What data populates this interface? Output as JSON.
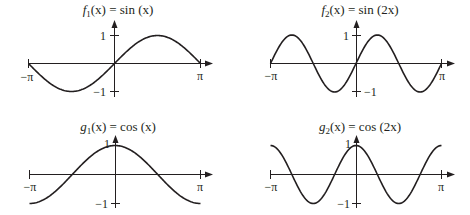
{
  "chart_data": [
    {
      "type": "line",
      "title": "f1(x) = sin (x)",
      "title_parts": {
        "fn": "f",
        "sub": "1",
        "rest": "(x) = sin (x)"
      },
      "x_ticks": [
        "−π",
        "π"
      ],
      "y_ticks": [
        "1",
        "−1"
      ],
      "xlim": [
        -3.14159,
        3.14159
      ],
      "ylim": [
        -1,
        1
      ],
      "func": "sin",
      "freq": 1,
      "series": [
        {
          "name": "sin(x)",
          "x": [
            -3.14,
            -1.57,
            0,
            1.57,
            3.14
          ],
          "values": [
            0,
            -1,
            0,
            1,
            0
          ]
        }
      ]
    },
    {
      "type": "line",
      "title": "f2(x) = sin (2x)",
      "title_parts": {
        "fn": "f",
        "sub": "2",
        "rest": "(x) = sin (2x)"
      },
      "x_ticks": [
        "−π",
        "π"
      ],
      "y_ticks": [
        "1",
        "−1"
      ],
      "xlim": [
        -3.14159,
        3.14159
      ],
      "ylim": [
        -1,
        1
      ],
      "func": "sin",
      "freq": 2,
      "series": [
        {
          "name": "sin(2x)",
          "x": [
            -3.14,
            -2.36,
            -1.57,
            -0.79,
            0,
            0.79,
            1.57,
            2.36,
            3.14
          ],
          "values": [
            0,
            1,
            0,
            -1,
            0,
            1,
            0,
            -1,
            0
          ]
        }
      ]
    },
    {
      "type": "line",
      "title": "g1(x) = cos (x)",
      "title_parts": {
        "fn": "g",
        "sub": "1",
        "rest": "(x) = cos (x)"
      },
      "x_ticks": [
        "−π",
        "π"
      ],
      "y_ticks": [
        "1",
        "−1"
      ],
      "xlim": [
        -3.14159,
        3.14159
      ],
      "ylim": [
        -1,
        1
      ],
      "func": "cos",
      "freq": 1,
      "series": [
        {
          "name": "cos(x)",
          "x": [
            -3.14,
            -1.57,
            0,
            1.57,
            3.14
          ],
          "values": [
            -1,
            0,
            1,
            0,
            -1
          ]
        }
      ]
    },
    {
      "type": "line",
      "title": "g2(x) = cos (2x)",
      "title_parts": {
        "fn": "g",
        "sub": "2",
        "rest": "(x) = cos (2x)"
      },
      "x_ticks": [
        "−π",
        "π"
      ],
      "y_ticks": [
        "1",
        "−1"
      ],
      "xlim": [
        -3.14159,
        3.14159
      ],
      "ylim": [
        -1,
        1
      ],
      "func": "cos",
      "freq": 2,
      "series": [
        {
          "name": "cos(2x)",
          "x": [
            -3.14,
            -2.36,
            -1.57,
            -0.79,
            0,
            0.79,
            1.57,
            2.36,
            3.14
          ],
          "values": [
            1,
            0,
            -1,
            0,
            1,
            0,
            -1,
            0,
            1
          ]
        }
      ]
    }
  ],
  "style": {
    "ink": "#231f20",
    "background": "#ffffff"
  }
}
